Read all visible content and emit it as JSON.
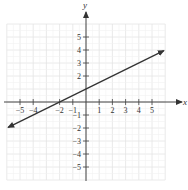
{
  "chart_data": {
    "type": "line",
    "title": "",
    "xlabel": "x",
    "ylabel": "y",
    "xlim": [
      -6,
      6
    ],
    "ylim": [
      -6,
      6
    ],
    "grid": true,
    "x_ticks": [
      -5,
      -4,
      -2,
      -1,
      1,
      2,
      3,
      4,
      5
    ],
    "y_ticks": [
      5,
      4,
      3,
      2,
      -1,
      -2,
      -3,
      -4,
      -5
    ],
    "x_tick_labels": [
      "−5",
      "−4",
      "−2",
      "−1",
      "1",
      "2",
      "3",
      "4",
      "5"
    ],
    "y_tick_labels": [
      "5",
      "4",
      "3",
      "2",
      "−1",
      "−2",
      "−3",
      "−4",
      "−5"
    ],
    "series": [
      {
        "name": "y = (1/2)x + 1",
        "slope": 0.5,
        "intercept": 1,
        "x": [
          -5.9,
          5.9
        ],
        "y": [
          -1.95,
          3.95
        ],
        "arrows": "both",
        "points_on_line": [
          [
            -2,
            0
          ],
          [
            0,
            1
          ]
        ]
      }
    ],
    "legend": null
  },
  "colors": {
    "grid": "#e4e4e4",
    "axis": "#444444",
    "line": "#333333",
    "text": "#333333"
  }
}
